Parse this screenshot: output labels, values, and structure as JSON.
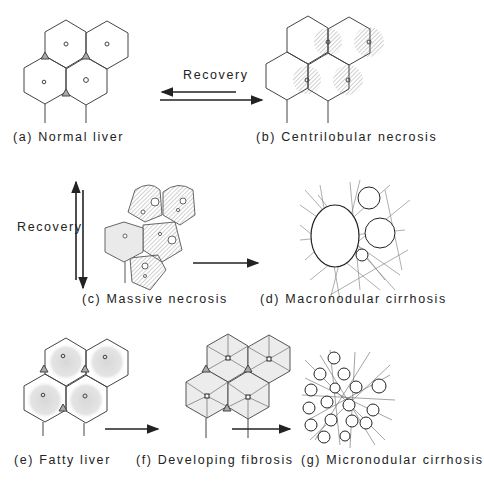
{
  "diagram": {
    "panels": [
      {
        "id": "a",
        "caption": "(a) Normal liver"
      },
      {
        "id": "b",
        "caption": "(b) Centrilobular necrosis"
      },
      {
        "id": "c",
        "caption": "(c) Massive necrosis"
      },
      {
        "id": "d",
        "caption": "(d) Macronodular cirrhosis"
      },
      {
        "id": "e",
        "caption": "(e) Fatty liver"
      },
      {
        "id": "f",
        "caption": "(f) Developing fibrosis"
      },
      {
        "id": "g",
        "caption": "(g) Micronodular  cirrhosis"
      }
    ],
    "arrows": [
      {
        "from": "b",
        "to": "a",
        "label": "Recovery",
        "style": "reversible-horizontal"
      },
      {
        "from": "a",
        "to": "c",
        "label": "Recovery",
        "style": "reversible-vertical"
      },
      {
        "from": "c",
        "to": "d",
        "label": "",
        "style": "single"
      },
      {
        "from": "e",
        "to": "f",
        "label": "",
        "style": "single"
      },
      {
        "from": "f",
        "to": "g",
        "label": "",
        "style": "single"
      }
    ],
    "arrow_labels": {
      "top_recovery": "Recovery",
      "side_recovery": "Recovery"
    },
    "colors": {
      "line": "#333333",
      "shading": "#c8c8c8",
      "background": "#ffffff"
    }
  }
}
